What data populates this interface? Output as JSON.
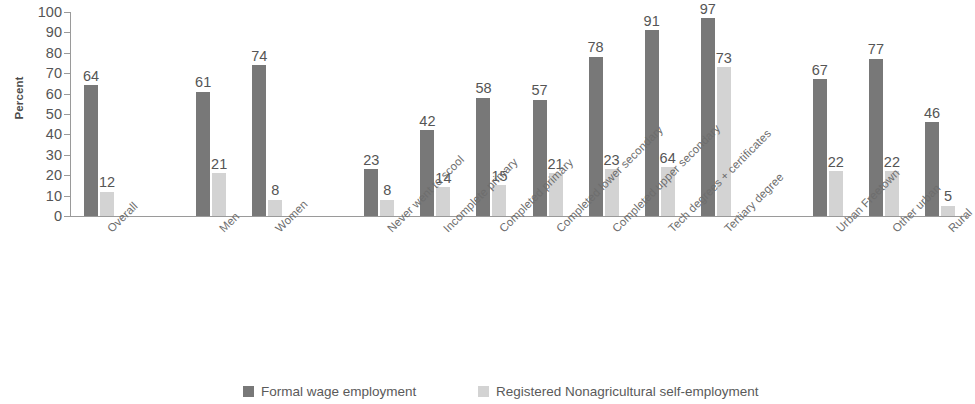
{
  "chart_data": {
    "type": "bar",
    "title": "",
    "xlabel": "",
    "ylabel": "Percent",
    "ylim": [
      0,
      100
    ],
    "ytick_labels": [
      "100",
      "90",
      "80",
      "70",
      "60",
      "50",
      "40",
      "30",
      "20",
      "10",
      "0"
    ],
    "ytick_values": [
      100,
      90,
      80,
      70,
      60,
      50,
      40,
      30,
      20,
      10,
      0
    ],
    "grid": false,
    "legend_position": "bottom",
    "categories": [
      "Overall",
      "Men",
      "Women",
      "Never went to scool",
      "Incomplete primary",
      "Completed primary",
      "Completed lower secondary",
      "Completed upper secondary",
      "Tech degrees + certificates",
      "Tertiary degree",
      "Urban Freetown",
      "Other urban",
      "Rural"
    ],
    "series": [
      {
        "name": "Formal wage employment",
        "color": "#787878",
        "values": [
          64,
          61,
          74,
          23,
          42,
          58,
          57,
          78,
          91,
          97,
          67,
          77,
          46
        ]
      },
      {
        "name": "Registered Nonagricultural self-employment",
        "color": "#d3d3d3",
        "values": [
          12,
          21,
          8,
          8,
          14,
          15,
          21,
          23,
          24,
          73,
          22,
          22,
          5
        ],
        "value_labels": [
          "12",
          "21",
          "8",
          "8",
          "14",
          "15",
          "21",
          "23",
          "64",
          "73",
          "22",
          "22",
          "5"
        ]
      }
    ],
    "group_breaks_after": [
      0,
      2,
      9
    ]
  },
  "legend": {
    "items": [
      {
        "label": "Formal wage employment"
      },
      {
        "label": "Registered Nonagricultural self-employment"
      }
    ]
  }
}
